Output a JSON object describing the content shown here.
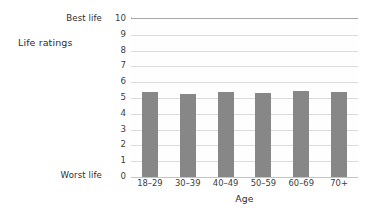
{
  "labels": {
    "series_label": "Life ratings",
    "best_life": "Best life",
    "worst_life": "Worst life"
  },
  "chart_data": {
    "type": "bar",
    "title": "",
    "xlabel": "Age",
    "ylabel": "",
    "categories": [
      "18–29",
      "30–39",
      "40–49",
      "50–59",
      "60–69",
      "70+"
    ],
    "values": [
      5.35,
      5.25,
      5.35,
      5.3,
      5.45,
      5.4
    ],
    "ylim": [
      0,
      10
    ],
    "ytick_labels": [
      "10",
      "9",
      "8",
      "7",
      "6",
      "5",
      "4",
      "3",
      "2",
      "1",
      "0"
    ],
    "ytick_values": [
      10,
      9,
      8,
      7,
      6,
      5,
      4,
      3,
      2,
      1,
      0
    ],
    "y_axis_endpoint_labels": {
      "max": "Best life",
      "min": "Worst life"
    },
    "grid": true,
    "legend": false,
    "series": [
      {
        "name": "Life ratings",
        "color": "#878787",
        "values": [
          5.35,
          5.25,
          5.35,
          5.3,
          5.45,
          5.4
        ]
      }
    ]
  },
  "colors": {
    "bar": "#878787",
    "gridline": "#dcdcdc",
    "plot_border": "#a8a8a8",
    "text": "#2e2e2e",
    "background": "#ffffff"
  }
}
